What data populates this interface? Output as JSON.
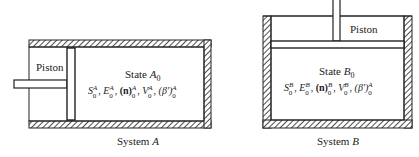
{
  "system_a": {
    "caption_prefix": "System ",
    "caption_letter": "A",
    "piston_label": "Piston",
    "state_prefix": "State ",
    "state_letter": "A",
    "state_sub": "0",
    "properties": [
      {
        "sym": "S",
        "sup": "A",
        "sub": "0"
      },
      {
        "sym": "E",
        "sup": "A",
        "sub": "0"
      },
      {
        "sym": "(n)",
        "sup": "A",
        "sub": "0"
      },
      {
        "sym": "V",
        "sup": "A",
        "sub": "0"
      },
      {
        "sym": "(β')",
        "sup": "A",
        "sub": "0"
      }
    ]
  },
  "system_b": {
    "caption_prefix": "System ",
    "caption_letter": "B",
    "piston_label": "Piston",
    "state_prefix": "State ",
    "state_letter": "B",
    "state_sub": "0",
    "properties": [
      {
        "sym": "S",
        "sup": "B",
        "sub": "0"
      },
      {
        "sym": "E",
        "sup": "B",
        "sub": "0"
      },
      {
        "sym": "(n)",
        "sup": "B",
        "sub": "0"
      },
      {
        "sym": "V",
        "sup": "B",
        "sub": "0"
      },
      {
        "sym": "(β')",
        "sup": "A",
        "sub": "0"
      }
    ]
  },
  "colors": {
    "ink": "#222222",
    "paper": "#ffffff"
  }
}
